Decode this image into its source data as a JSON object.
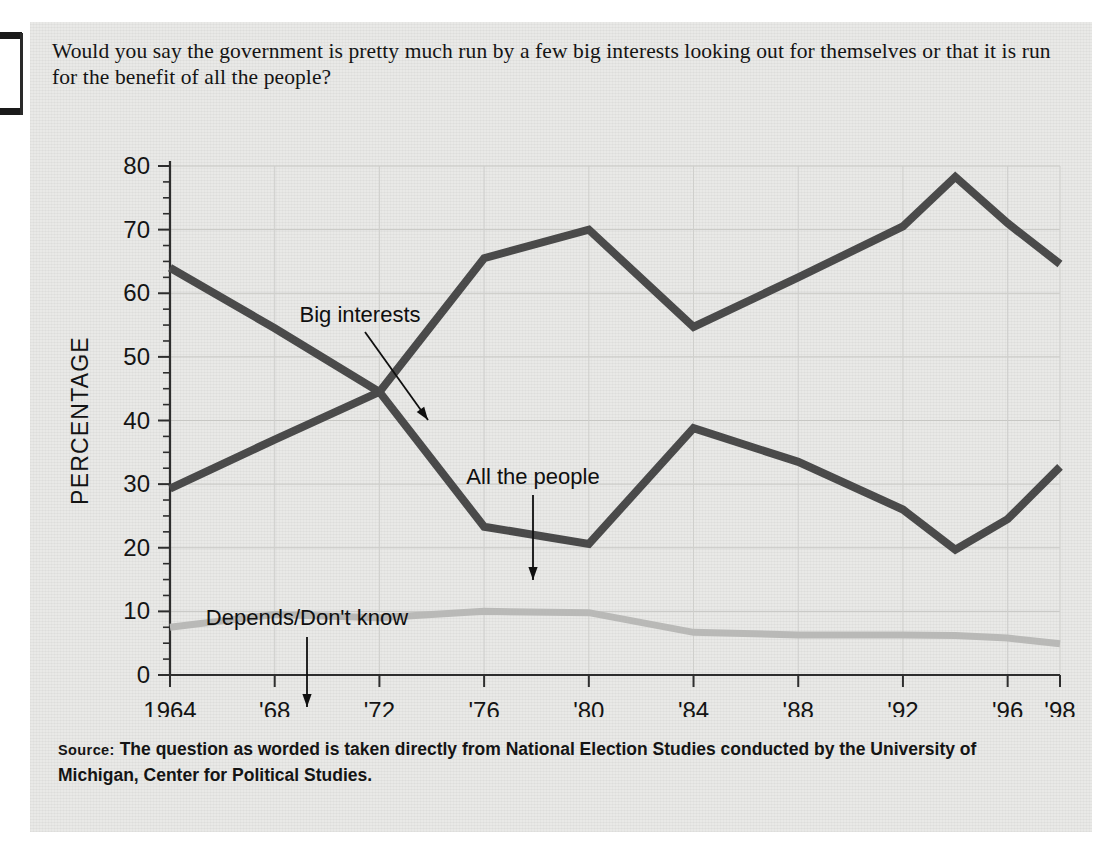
{
  "question": "Would you say the government is pretty much run by a few big interests looking out for themselves or that it is run for the benefit of all the people?",
  "source": {
    "label": "Source:",
    "text": " The question as worded is taken directly from National Election Studies conducted by the University of Michigan, Center for Political Studies."
  },
  "chart_data": {
    "type": "line",
    "title": "",
    "xlabel": "ELECTION YEAR",
    "ylabel": "PERCENTAGE",
    "xlim": [
      1964,
      1998
    ],
    "ylim": [
      0,
      80
    ],
    "yticks": [
      0,
      10,
      20,
      30,
      40,
      50,
      60,
      70,
      80
    ],
    "ytick_labels": [
      "0",
      "10",
      "20",
      "30",
      "40",
      "50",
      "60",
      "70",
      "80"
    ],
    "minor_y_interval": 2.5,
    "xticks": [
      1964,
      1968,
      1972,
      1976,
      1980,
      1984,
      1988,
      1992,
      1996,
      1998
    ],
    "xtick_labels": [
      "1964",
      "'68",
      "'72",
      "'76",
      "'80",
      "'84",
      "'88",
      "'92",
      "'96",
      "'98"
    ],
    "grid": "horizontal-and-vertical-light",
    "legend": "inline-annotations",
    "x": [
      1964,
      1968,
      1972,
      1976,
      1980,
      1984,
      1988,
      1992,
      1994,
      1996,
      1998
    ],
    "series": [
      {
        "name": "All the people",
        "color": "#4a4a4a",
        "values": [
          64.0,
          54.5,
          44.5,
          65.5,
          70.0,
          54.7,
          62.5,
          70.5,
          78.3,
          71.0,
          64.6
        ]
      },
      {
        "name": "Big interests",
        "color": "#4a4a4a",
        "values": [
          29.3,
          37.0,
          44.5,
          23.3,
          20.6,
          38.8,
          33.5,
          26.0,
          19.7,
          24.5,
          32.7
        ]
      },
      {
        "name": "Depends/Don't know",
        "color": "#b9b9b7",
        "values": [
          7.5,
          9.5,
          9.0,
          10.0,
          9.8,
          6.7,
          6.3,
          6.3,
          6.2,
          5.8,
          4.9
        ]
      }
    ],
    "annotations": [
      {
        "label": "Big interests",
        "target_x": 1972,
        "target_y": 46
      },
      {
        "label": "All the people",
        "target_x": 1977,
        "target_y": 23.5
      },
      {
        "label": "Depends/Don't know",
        "target_x": 1971,
        "target_y": 10
      }
    ]
  }
}
